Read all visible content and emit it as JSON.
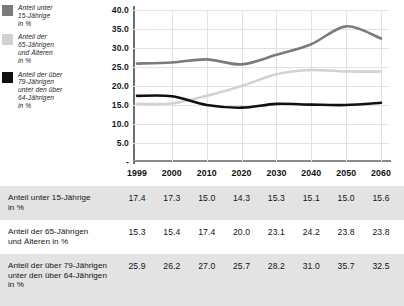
{
  "legend": {
    "items": [
      {
        "label": "Anteil unter\n15-Jährige\nin %",
        "color": "#7b7b7b",
        "icon": "legend-swatch"
      },
      {
        "label": "Anteil der\n65-Jährigen\nund Älteren\nin %",
        "color": "#d2d2d2",
        "icon": "legend-swatch"
      },
      {
        "label": "Anteil der über\n79-Jährigen\nunter den über\n64-Jährigen\nin %",
        "color": "#111111",
        "icon": "legend-swatch"
      }
    ]
  },
  "chart_data": {
    "type": "line",
    "title": "",
    "xlabel": "",
    "ylabel": "",
    "ylim": [
      0,
      40
    ],
    "ytick_labels": [
      "40.0",
      "35.0",
      "30.0",
      "25.0",
      "20.0",
      "15.0",
      "10.0",
      "5.0",
      "-"
    ],
    "ytick_values": [
      40,
      35,
      30,
      25,
      20,
      15,
      10,
      5,
      0
    ],
    "grid": true,
    "legend_position": "left",
    "categories": [
      "1999",
      "2000",
      "2010",
      "2020",
      "2030",
      "2040",
      "2050",
      "2060"
    ],
    "x": [
      1999,
      2000,
      2010,
      2020,
      2030,
      2040,
      2050,
      2060
    ],
    "series": [
      {
        "name": "Anteil der über 79-Jährigen unter den über 64-Jährigen in %",
        "color": "#7b7b7b",
        "values": [
          25.9,
          26.2,
          27.0,
          25.7,
          28.2,
          31.0,
          35.7,
          32.5
        ]
      },
      {
        "name": "Anteil der 65-Jährigen und Älteren in %",
        "color": "#d2d2d2",
        "values": [
          15.3,
          15.4,
          17.4,
          20.0,
          23.1,
          24.2,
          23.8,
          23.8
        ]
      },
      {
        "name": "Anteil unter 15-Jährige in %",
        "color": "#111111",
        "values": [
          17.4,
          17.3,
          15.0,
          14.3,
          15.3,
          15.1,
          15.0,
          15.6
        ]
      }
    ]
  },
  "table": {
    "columns": [
      "1999",
      "2000",
      "2010",
      "2020",
      "2030",
      "2040",
      "2050",
      "2060"
    ],
    "rows": [
      {
        "label": "Anteil unter 15-Jährige\nin %",
        "values": [
          "17.4",
          "17.3",
          "15.0",
          "14.3",
          "15.3",
          "15.1",
          "15.0",
          "15.6"
        ]
      },
      {
        "label": "Anteil der 65-Jährigen\nund Älteren in %",
        "values": [
          "15.3",
          "15.4",
          "17.4",
          "20.0",
          "23.1",
          "24.2",
          "23.8",
          "23.8"
        ]
      },
      {
        "label": "Anteil der über 79-Jährigen\nunter den über 64-Jährigen\nin %",
        "values": [
          "25.9",
          "26.2",
          "27.0",
          "25.7",
          "28.2",
          "31.0",
          "35.7",
          "32.5"
        ]
      }
    ]
  },
  "colors": {
    "series_dark_gray": "#7b7b7b",
    "series_light_gray": "#d2d2d2",
    "series_black": "#111111",
    "row_shade": "#e3e3e3",
    "gridline": "#e2e2e2",
    "axis": "#6e6e6e"
  }
}
